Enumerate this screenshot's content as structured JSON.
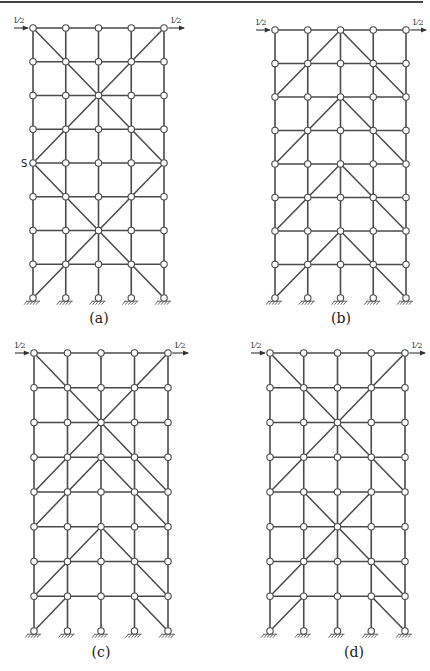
{
  "figure": {
    "top_rule": true,
    "grid": {
      "columns": 5,
      "rows": 9,
      "joint_radius": 3.2
    },
    "panels": [
      {
        "id": "a",
        "label": "(a)",
        "origin": [
          33,
          28
        ],
        "width": 131,
        "height": 270,
        "load_left": "1/2",
        "load_right": "1/2",
        "node_labels": [
          {
            "text": "S",
            "col": 0,
            "row": 4
          }
        ],
        "braces": [
          [
            [
              0,
              0
            ],
            [
              4,
              4
            ]
          ],
          [
            [
              4,
              0
            ],
            [
              0,
              4
            ]
          ],
          [
            [
              0,
              4
            ],
            [
              4,
              8
            ]
          ],
          [
            [
              4,
              4
            ],
            [
              0,
              8
            ]
          ]
        ],
        "label_pos": [
          99,
          323
        ]
      },
      {
        "id": "b",
        "label": "(b)",
        "origin": [
          275,
          30
        ],
        "width": 131,
        "height": 268,
        "load_left": "1/2",
        "load_right": "1/2",
        "node_labels": [],
        "braces": [
          [
            [
              2,
              0
            ],
            [
              0,
              2
            ]
          ],
          [
            [
              2,
              0
            ],
            [
              4,
              2
            ]
          ],
          [
            [
              2,
              2
            ],
            [
              0,
              4
            ]
          ],
          [
            [
              2,
              2
            ],
            [
              4,
              4
            ]
          ],
          [
            [
              2,
              4
            ],
            [
              0,
              6
            ]
          ],
          [
            [
              2,
              4
            ],
            [
              4,
              6
            ]
          ],
          [
            [
              2,
              6
            ],
            [
              0,
              8
            ]
          ],
          [
            [
              2,
              6
            ],
            [
              4,
              8
            ]
          ]
        ],
        "label_pos": [
          341,
          323
        ]
      },
      {
        "id": "c",
        "label": "(c)",
        "origin": [
          34,
          353
        ],
        "width": 134,
        "height": 278,
        "load_left": "1/2",
        "load_right": "1/2",
        "node_labels": [],
        "braces": [
          [
            [
              0,
              0
            ],
            [
              3,
              3
            ]
          ],
          [
            [
              4,
              0
            ],
            [
              1,
              3
            ]
          ],
          [
            [
              3,
              3
            ],
            [
              4,
              4
            ]
          ],
          [
            [
              1,
              3
            ],
            [
              0,
              4
            ]
          ],
          [
            [
              2,
              3
            ],
            [
              0,
              5
            ]
          ],
          [
            [
              2,
              3
            ],
            [
              4,
              5
            ]
          ],
          [
            [
              2,
              5
            ],
            [
              0,
              7
            ]
          ],
          [
            [
              2,
              5
            ],
            [
              4,
              7
            ]
          ],
          [
            [
              1,
              7
            ],
            [
              0,
              8
            ]
          ],
          [
            [
              3,
              7
            ],
            [
              4,
              8
            ]
          ]
        ],
        "label_pos": [
          101,
          657
        ]
      },
      {
        "id": "d",
        "label": "(d)",
        "origin": [
          270,
          353
        ],
        "width": 135,
        "height": 278,
        "load_left": "1/2",
        "load_right": "1/2",
        "node_labels": [],
        "braces": [
          [
            [
              0,
              0
            ],
            [
              4,
              4
            ]
          ],
          [
            [
              4,
              0
            ],
            [
              0,
              4
            ]
          ],
          [
            [
              1,
              4
            ],
            [
              4,
              7
            ]
          ],
          [
            [
              3,
              4
            ],
            [
              0,
              7
            ]
          ],
          [
            [
              1,
              7
            ],
            [
              0,
              8
            ]
          ],
          [
            [
              3,
              7
            ],
            [
              4,
              8
            ]
          ]
        ],
        "label_pos": [
          354,
          657
        ]
      }
    ]
  }
}
